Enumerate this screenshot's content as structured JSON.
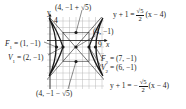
{
  "diagram": {
    "type": "hyperbola-graph",
    "equation_center": "(4, -1)",
    "grid": {
      "x_min": -1,
      "x_max": 9,
      "y_min": -7,
      "y_max": 5,
      "unit_px": 6.5
    },
    "axis_labels": {
      "x": "x",
      "y": "y",
      "y_tick": "4",
      "x_tick": "9"
    },
    "points": {
      "top": {
        "label": "(4, −1 + √5)",
        "x": 4,
        "y": 1.236
      },
      "bottom": {
        "label": "(4, −1 − √5)",
        "x": 4,
        "y": -3.236
      },
      "center": {
        "label": "(4, −1)",
        "x": 4,
        "y": -1
      },
      "F1": {
        "name": "F",
        "sub": "1",
        "label": " = (1, −1)",
        "x": 1,
        "y": -1
      },
      "V1": {
        "name": "V",
        "sub": "1",
        "label": " = (2, −1)",
        "x": 2,
        "y": -1
      },
      "F2": {
        "name": "F",
        "sub": "2",
        "label": " = (7, −1)",
        "x": 7,
        "y": -1
      },
      "V2": {
        "name": "V",
        "sub": "2",
        "label": " = (6, −1)",
        "x": 6,
        "y": -1
      }
    },
    "asymptotes": {
      "positive": {
        "lhs": "y + 1 = ",
        "num": "√5",
        "den": "2",
        "rhs": "(x − 4)"
      },
      "negative": {
        "lhs": "y + 1 = −",
        "num": "√5",
        "den": "2",
        "rhs": "(x − 4)"
      }
    },
    "colors": {
      "grid": "#b8b8b8",
      "curve": "#1a1a1a",
      "text": "#1a1a1a"
    }
  }
}
